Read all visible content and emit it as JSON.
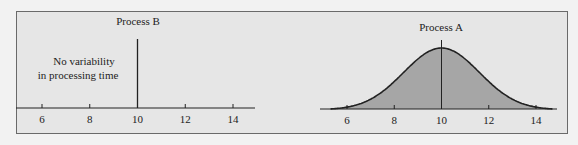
{
  "chart_data": [
    {
      "type": "line",
      "title": "Process B",
      "annotation": [
        "No variability",
        "in processing time"
      ],
      "xlabel": "",
      "ylabel": "",
      "x_ticks": [
        6,
        8,
        10,
        12,
        14
      ],
      "xlim": [
        4.9,
        15
      ],
      "spike_at": 10,
      "description": "Single vertical line at x=10 (zero variance)"
    },
    {
      "type": "area",
      "title": "Process A",
      "xlabel": "",
      "ylabel": "",
      "x_ticks": [
        6,
        8,
        10,
        12,
        14
      ],
      "xlim": [
        4.9,
        15
      ],
      "distribution": {
        "kind": "normal",
        "mean": 10,
        "sd": 1.6
      },
      "mean_line_at": 10
    }
  ],
  "colors": {
    "fill": "#a6a6a6",
    "line": "#222222",
    "background": "#e6e6e6"
  }
}
